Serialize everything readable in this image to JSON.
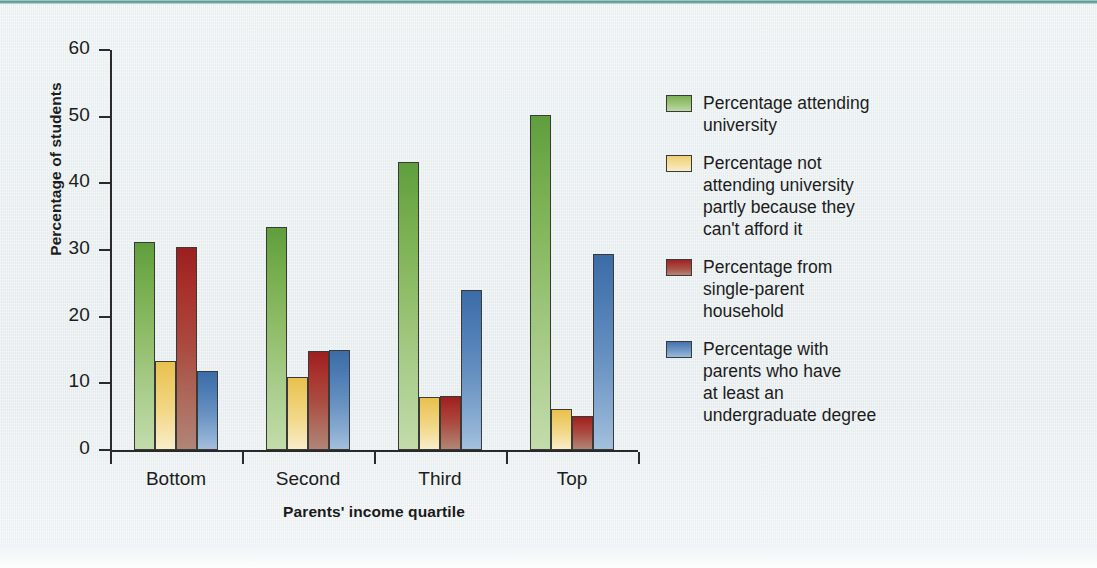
{
  "figure": {
    "background_color": "#eaf0f2",
    "top_rule_color": "#4e8f8c",
    "axis_color": "#2a2a2a"
  },
  "axes": {
    "y_title": "Percentage of students",
    "x_title": "Parents' income quartile",
    "y_ticks": [
      "0",
      "10",
      "20",
      "30",
      "40",
      "50",
      "60"
    ],
    "x_labels": [
      "Bottom",
      "Second",
      "Third",
      "Top"
    ]
  },
  "legend": {
    "position": "right",
    "items": [
      {
        "label": "Percentage attending\nuniversity",
        "color": "#7cb254",
        "name": "attending-university"
      },
      {
        "label": "Percentage not\nattending university\npartly because they\ncan't afford it",
        "color": "#eecf73",
        "name": "cannot-afford"
      },
      {
        "label": "Percentage from\nsingle-parent\nhousehold",
        "color": "#9e2423",
        "name": "single-parent-household"
      },
      {
        "label": "Percentage with\nparents who have\nat least an\nundergraduate degree",
        "color": "#4673ac",
        "name": "parents-undergraduate-degree"
      }
    ]
  },
  "chart_data": {
    "type": "bar",
    "title": "",
    "xlabel": "Parents' income quartile",
    "ylabel": "Percentage of students",
    "categories": [
      "Bottom",
      "Second",
      "Third",
      "Top"
    ],
    "ylim": [
      0,
      60
    ],
    "yticks": [
      0,
      10,
      20,
      30,
      40,
      50,
      60
    ],
    "grid": false,
    "legend_position": "right",
    "series": [
      {
        "name": "Percentage attending university",
        "color": "#7cb254",
        "values": [
          31.2,
          33.4,
          43.2,
          50.2
        ]
      },
      {
        "name": "Percentage not attending university partly because they can't afford it",
        "color": "#eecf73",
        "values": [
          13.4,
          11.0,
          8.0,
          6.1
        ]
      },
      {
        "name": "Percentage from single-parent household",
        "color": "#9e2423",
        "values": [
          30.4,
          14.8,
          8.1,
          5.1
        ]
      },
      {
        "name": "Percentage with parents who have at least an undergraduate degree",
        "color": "#4673ac",
        "values": [
          11.9,
          15.0,
          24.0,
          29.4
        ]
      }
    ]
  }
}
